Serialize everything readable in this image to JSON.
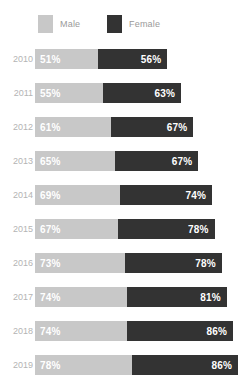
{
  "legend": {
    "items": [
      {
        "label": "Male",
        "color": "#c8c8c8",
        "swatch_name": "male-swatch"
      },
      {
        "label": "Female",
        "color": "#333333",
        "swatch_name": "female-swatch"
      }
    ]
  },
  "chart_data": {
    "type": "bar",
    "orientation": "horizontal",
    "stacked": true,
    "title": "",
    "subtitle": "",
    "xlabel": "",
    "ylabel": "",
    "grid": false,
    "legend_position": "top-left",
    "categories": [
      "2010",
      "2011",
      "2012",
      "2013",
      "2014",
      "2015",
      "2016",
      "2017",
      "2018",
      "2019"
    ],
    "series": [
      {
        "name": "Male",
        "color": "#c8c8c8",
        "values": [
          51,
          55,
          61,
          65,
          69,
          67,
          73,
          74,
          74,
          78
        ]
      },
      {
        "name": "Female",
        "color": "#333333",
        "values": [
          56,
          63,
          67,
          67,
          74,
          78,
          78,
          81,
          86,
          86
        ]
      }
    ],
    "value_labels": {
      "Male": [
        "51%",
        "55%",
        "61%",
        "65%",
        "69%",
        "67%",
        "73%",
        "74%",
        "74%",
        "78%"
      ],
      "Female": [
        "56%",
        "63%",
        "67%",
        "67%",
        "74%",
        "78%",
        "78%",
        "81%",
        "86%",
        "86%"
      ]
    },
    "totals": [
      107,
      118,
      128,
      132,
      143,
      145,
      151,
      155,
      160,
      164
    ],
    "xlim": [
      0,
      164
    ],
    "unit": "%"
  },
  "layout": {
    "bar_start_px": 35,
    "px_per_unit": 1.238,
    "row_pitch_px": 34,
    "bar_height_px": 20,
    "first_bar_top_px": 3
  }
}
